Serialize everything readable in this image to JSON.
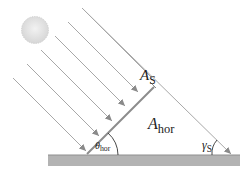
{
  "diagram": {
    "title": "",
    "labels": {
      "tilted_area": {
        "symbol": "A",
        "subscript": "S"
      },
      "horizontal_area": {
        "symbol": "A",
        "subscript": "hor"
      },
      "tilt_angle": {
        "symbol": "θ",
        "subscript": "hor"
      },
      "sun_elevation_angle": {
        "symbol": "γ",
        "subscript": "S"
      }
    },
    "elements": [
      "sun",
      "parallel-sun-rays",
      "tilted-surface",
      "ground"
    ],
    "colors": {
      "ray": "#a8a8a8",
      "arrowhead": "#8a8a8a",
      "tilted_surface": "#8c8c8c",
      "ground": "#b0b0b0",
      "ground_edge": "#8f8f8f",
      "sun": "#e2e2e2",
      "text": "#222222"
    }
  }
}
